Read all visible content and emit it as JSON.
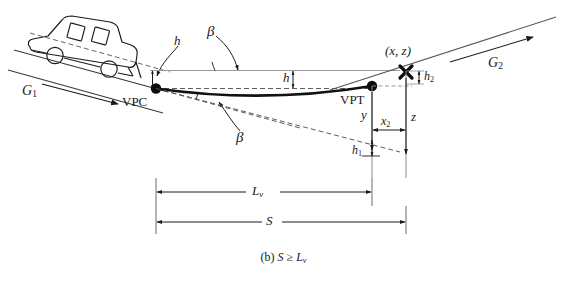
{
  "figure": {
    "caption_prefix": "(b)",
    "caption_body": "S ≥ L",
    "caption_sub": "v",
    "background_color": "#ffffff",
    "ink_color": "#1a1a1a",
    "gray_color": "#8a8a8a"
  },
  "labels": {
    "grade_in": "G",
    "grade_in_sub": "1",
    "grade_out": "G",
    "grade_out_sub": "2",
    "vpc": "VPC",
    "vpt": "VPT",
    "beta_upper": "β",
    "beta_lower": "β",
    "h_driver": "h",
    "h_mid": "h",
    "h1": "h",
    "h1_sub": "1",
    "h2": "h",
    "h2_sub": "2",
    "point_xz": "(x, z)",
    "y": "y",
    "z": "z",
    "x2": "x",
    "x2_sub": "2",
    "length_lv": "L",
    "length_lv_sub": "v",
    "sight_s": "S"
  },
  "geometry": {
    "vpc_point": "filled-circle",
    "vpt_point": "filled-circle",
    "object_marker": "x-cross",
    "curve_type": "sag-vertical-curve",
    "vehicle": "passenger-car-silhouette"
  }
}
